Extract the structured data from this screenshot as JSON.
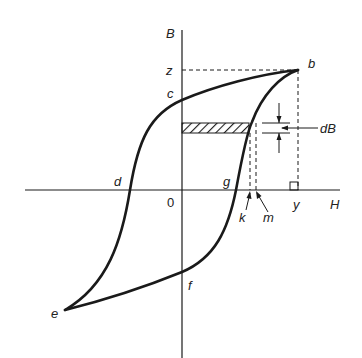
{
  "diagram": {
    "type": "hysteresis-loop",
    "axes": {
      "vertical_label": "B",
      "horizontal_label": "H",
      "origin_label": "0"
    },
    "points": {
      "b": "b",
      "c": "c",
      "d": "d",
      "e": "e",
      "f": "f",
      "g": "g",
      "k": "k",
      "m": "m",
      "y": "y",
      "z": "z"
    },
    "annotations": {
      "increment": "dB"
    },
    "colors": {
      "line": "#1a1a1a",
      "background": "#ffffff"
    }
  }
}
